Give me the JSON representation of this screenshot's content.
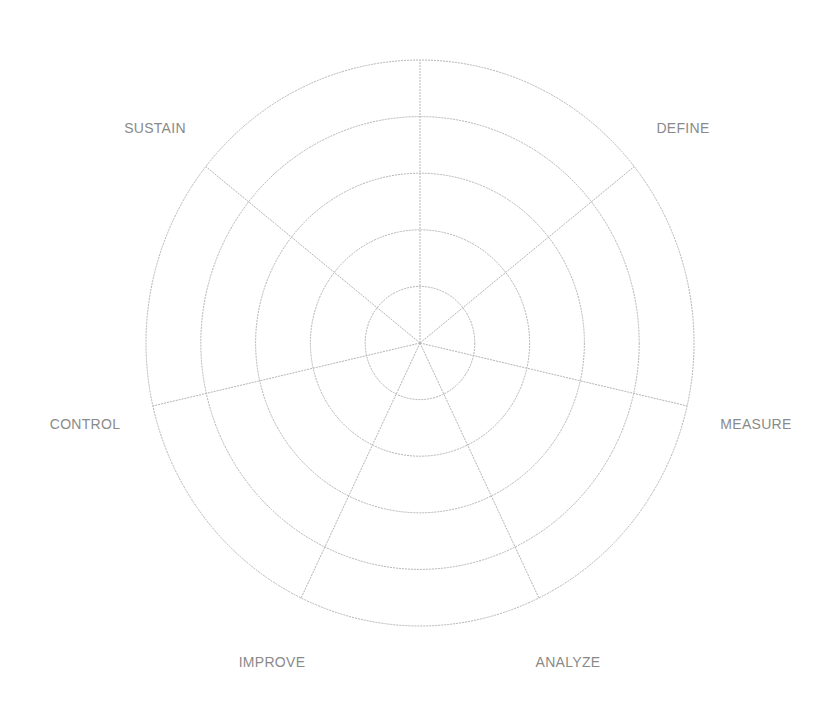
{
  "diagram": {
    "type": "radar-grid",
    "center": {
      "x": 420,
      "y": 343
    },
    "radius": {
      "x": 274,
      "y": 283
    },
    "ring_count": 5,
    "line_color": "#b4b4b4",
    "label_color": "#8a8a8a",
    "axes": [
      {
        "label": "DEFINE",
        "label_x": 683,
        "label_y": 128
      },
      {
        "label": "MEASURE",
        "label_x": 756,
        "label_y": 424
      },
      {
        "label": "ANALYZE",
        "label_x": 568,
        "label_y": 662
      },
      {
        "label": "IMPROVE",
        "label_x": 272,
        "label_y": 662
      },
      {
        "label": "CONTROL",
        "label_x": 85,
        "label_y": 424
      },
      {
        "label": "SUSTAIN",
        "label_x": 155,
        "label_y": 128
      }
    ]
  },
  "chart_data": {
    "type": "radar",
    "title": "",
    "categories": [
      "DEFINE",
      "MEASURE",
      "ANALYZE",
      "IMPROVE",
      "CONTROL",
      "SUSTAIN"
    ],
    "spoke_count": 7,
    "rings": 5,
    "series": []
  }
}
